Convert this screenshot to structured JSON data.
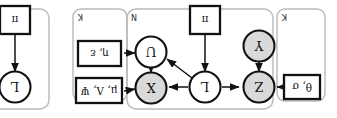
{
  "figure": {
    "orientation": "rotated-180",
    "colors": {
      "observed_node_fill": "#d9d9d9",
      "latent_node_fill": "#ffffff",
      "stroke": "#111111",
      "plate_stroke": "#b9b9b9",
      "background": "#ffffff"
    }
  },
  "plates": [
    {
      "id": "plate-k-left",
      "label": "K"
    },
    {
      "id": "plate-n",
      "label": "N"
    },
    {
      "id": "plate-k-right",
      "label": "K"
    },
    {
      "id": "plate-n-2",
      "label": "N"
    }
  ],
  "nodes": [
    {
      "id": "node-z",
      "label": "Z",
      "type": "observed"
    },
    {
      "id": "node-y",
      "label": "Y",
      "type": "observed"
    },
    {
      "id": "node-l",
      "label": "L",
      "type": "latent"
    },
    {
      "id": "node-x",
      "label": "X",
      "type": "observed"
    },
    {
      "id": "node-u",
      "label": "U",
      "type": "latent"
    },
    {
      "id": "node-l2",
      "label": "L",
      "type": "latent"
    }
  ],
  "parameters": [
    {
      "id": "param-theta-sigma",
      "label": "θ, σ"
    },
    {
      "id": "param-mu-lambda-psi",
      "label": "μ, Λ, Ψ"
    },
    {
      "id": "param-eta-epsilon",
      "label": "η, ε"
    },
    {
      "id": "param-pi",
      "label": "π"
    },
    {
      "id": "param-pi-2",
      "label": "π"
    }
  ],
  "edges": [
    {
      "id": "edge-theta-to-z",
      "from": "param-theta-sigma",
      "to": "node-z"
    },
    {
      "id": "edge-y-to-z",
      "from": "node-y",
      "to": "node-z"
    },
    {
      "id": "edge-l-to-z",
      "from": "node-l",
      "to": "node-z"
    },
    {
      "id": "edge-l-to-x",
      "from": "node-l",
      "to": "node-x"
    },
    {
      "id": "edge-l-to-u",
      "from": "node-l",
      "to": "node-u"
    },
    {
      "id": "edge-pi-to-l",
      "from": "param-pi",
      "to": "node-l"
    },
    {
      "id": "edge-mu-to-x",
      "from": "param-mu-lambda-psi",
      "to": "node-x"
    },
    {
      "id": "edge-eta-to-u",
      "from": "param-eta-epsilon",
      "to": "node-u"
    },
    {
      "id": "edge-u-to-x",
      "from": "node-u",
      "to": "node-x"
    },
    {
      "id": "edge-pi2-to-l2",
      "from": "param-pi-2",
      "to": "node-l2"
    }
  ]
}
